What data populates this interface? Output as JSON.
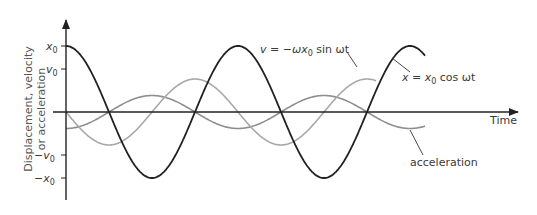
{
  "chart_data": {
    "type": "line",
    "title": "",
    "xlabel": "Time",
    "ylabel": "Displacement, velocity or acceleration",
    "ylabel_lines": [
      "Displacement, velocity",
      "or acceleration"
    ],
    "y_ticks": [
      {
        "label": "x₀",
        "value": 1.0
      },
      {
        "label": "v₀",
        "value": 0.5
      },
      {
        "label": "−v₀",
        "value": -0.5
      },
      {
        "label": "−x₀",
        "value": -1.0
      }
    ],
    "series": [
      {
        "name": "displacement",
        "label": "x = x₀ cos ωt",
        "formula": "x0*cos(wt)",
        "amplitude": 1.0,
        "phase": "cos",
        "color": "#222222"
      },
      {
        "name": "velocity",
        "label": "v = −ωx₀ sin ωt",
        "formula": "-w*x0*sin(wt)",
        "amplitude": 0.5,
        "phase": "-sin",
        "color": "#a0a0a0"
      },
      {
        "name": "acceleration",
        "label": "acceleration",
        "formula": "-w^2*x0*cos(wt)",
        "amplitude": 0.25,
        "phase": "-cos",
        "color": "#909090"
      }
    ],
    "x_range_periods": [
      0,
      2.1
    ],
    "grid": false,
    "legend": "inline annotations"
  },
  "labels": {
    "y_axis_l1": "Displacement, velocity",
    "y_axis_l2": "or acceleration",
    "x_axis": "Time",
    "tick_x0": "x",
    "tick_v0": "v",
    "tick_neg_v0": "−v",
    "tick_neg_x0": "−x",
    "sub0": "0",
    "disp_pre": "x = x",
    "disp_post": " cos ωt",
    "vel_pre": "v = −ωx",
    "vel_post": " sin ωt",
    "acc": "acceleration"
  }
}
